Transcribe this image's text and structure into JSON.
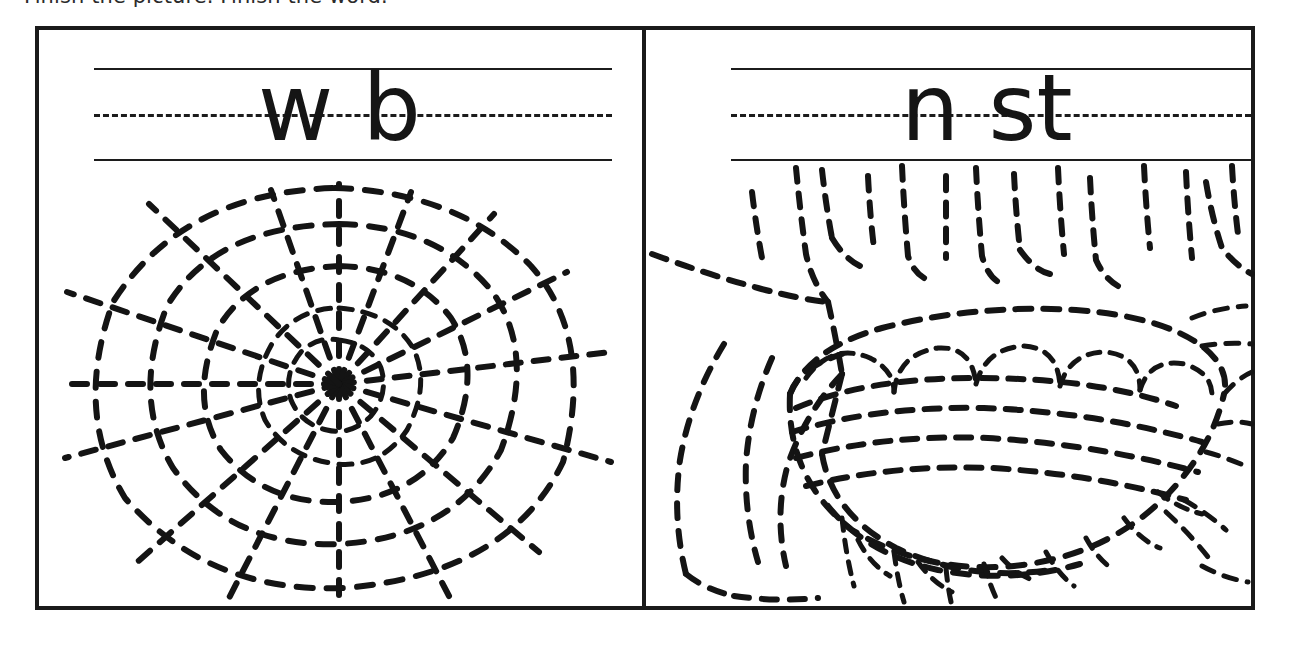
{
  "worksheet": {
    "instruction": "Finish the picture. Finish the word.",
    "border_color": "#1a1a1a",
    "ink_color": "#141414",
    "paper_color": "#ffffff",
    "panels": [
      {
        "id": "panel-web",
        "word_answer": "web",
        "letters_shown": "w b",
        "missing_letter": "e",
        "picture": "spider-web",
        "picture_style": "dashed-trace",
        "guide_lines": [
          "solid-top",
          "dashed-middle",
          "solid-bottom"
        ]
      },
      {
        "id": "panel-nest",
        "word_answer": "nest",
        "letters_shown": "n st",
        "missing_letter": "e",
        "picture": "birds-nest-in-branches",
        "picture_style": "dashed-trace",
        "guide_lines": [
          "solid-top",
          "dashed-middle",
          "solid-bottom"
        ]
      }
    ]
  }
}
